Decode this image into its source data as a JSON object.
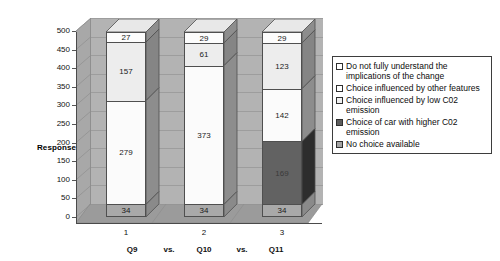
{
  "chart_data": {
    "type": "bar",
    "subtype": "stacked-3d-column",
    "title": "",
    "xlabel": "Q9  vs.  Q10  vs.  Q11",
    "ylabel": "Response",
    "ylim": [
      0,
      500
    ],
    "ytick_step": 50,
    "yticks": [
      "500",
      "450",
      "400",
      "350",
      "300",
      "250",
      "200",
      "150",
      "100",
      "50",
      "0"
    ],
    "categories": [
      "1",
      "2",
      "3"
    ],
    "grid": true,
    "legend_position": "right",
    "series": [
      {
        "name": "No choice available",
        "color": "#a9a9a9",
        "side_color": "#8a8a8a",
        "top_color": "#c4c4c4",
        "values": [
          34,
          34,
          34
        ]
      },
      {
        "name": "Choice of car with higher C02 emission",
        "color": "#626262",
        "side_color": "#2d2d2d",
        "top_color": "#7e7e7e",
        "values": [
          0,
          0,
          169
        ]
      },
      {
        "name": "Choice influenced by low C02 emission",
        "color": "#fbfbfb",
        "side_color": "#8d8d8d",
        "top_color": "#e6e6e6",
        "values": [
          279,
          373,
          142
        ]
      },
      {
        "name": "Choice influenced by other features",
        "color": "#ededed",
        "side_color": "#858585",
        "top_color": "#dcdcdc",
        "values": [
          157,
          61,
          123
        ]
      },
      {
        "name": "Do not fully understand the implications of the change",
        "color": "#fcfcfc",
        "side_color": "#8d8d8d",
        "top_color": "#e8e8e8",
        "values": [
          27,
          29,
          29
        ]
      }
    ]
  },
  "axis": {
    "y_title": "Response",
    "x_category_line": [
      {
        "text": "Q9"
      },
      {
        "text": "vs."
      },
      {
        "text": "Q10"
      },
      {
        "text": "vs."
      },
      {
        "text": "Q11"
      }
    ]
  },
  "legend": {
    "items": [
      {
        "label": "Do not fully understand the implications of the change",
        "swatch": "#ffffff"
      },
      {
        "label": "Choice influenced by other features",
        "swatch": "#ffffff"
      },
      {
        "label": "Choice influenced by low C02 emission",
        "swatch": "#f0f0f0"
      },
      {
        "label": "Choice of car with higher C02 emission",
        "swatch": "#5c5c5c"
      },
      {
        "label": "No choice available",
        "swatch": "#a3a3a3"
      }
    ]
  },
  "colors": {
    "plot_back_wall": "#b3b3b3",
    "plot_side_wall": "#a8a8a8",
    "plot_floor": "#9b9b9b",
    "gridline": "#9d9d9d",
    "axis": "#4a4a4a",
    "text": "#111111"
  }
}
